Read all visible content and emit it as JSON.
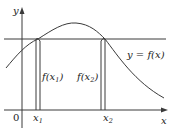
{
  "diagram": {
    "axes": {
      "x_label": "x",
      "y_label": "y",
      "origin_label": "0"
    },
    "curve_label": "y = f(x)",
    "points": [
      {
        "name": "x1",
        "label_base": "x",
        "label_sub": "1",
        "value_label_pre": "f(x",
        "value_label_sub": "1",
        "value_label_post": ")"
      },
      {
        "name": "x2",
        "label_base": "x",
        "label_sub": "2",
        "value_label_pre": "f(x",
        "value_label_sub": "2",
        "value_label_post": ")"
      }
    ],
    "relation": "horizontal line at equal height f(x1) = f(x2)"
  }
}
